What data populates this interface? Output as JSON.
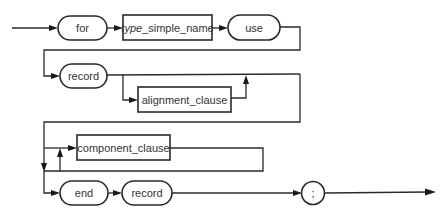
{
  "diagram": {
    "type": "syntax-railroad",
    "nodes": {
      "for": "for",
      "type_prefix": "type",
      "type_rest": "_simple_name",
      "use": "use",
      "record1": "record",
      "alignment_clause": "alignment_clause",
      "component_clause": "component_clause",
      "end": "end",
      "record2": "record",
      "semicolon": ";"
    },
    "sequence": [
      "for",
      "type_simple_name",
      "use",
      "record",
      "[alignment_clause]",
      "{component_clause}",
      "end",
      "record",
      ";"
    ],
    "colors": {
      "line": "#2a2a2a",
      "background": "#ffffff"
    }
  }
}
